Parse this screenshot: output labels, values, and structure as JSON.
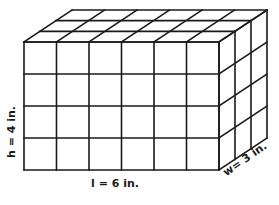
{
  "figure": {
    "grid": {
      "length_units": 6,
      "height_units": 4,
      "width_units": 3
    },
    "labels": {
      "height": "h = 4 in.",
      "length": "l = 6 in.",
      "width": "w= 3 in."
    },
    "colors": {
      "line": "#1a1a1a",
      "background": "#ffffff"
    }
  }
}
